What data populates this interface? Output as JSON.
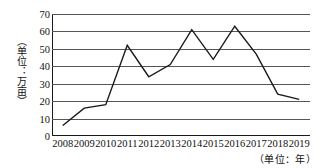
{
  "chart_data": {
    "type": "line",
    "title": "",
    "subtitle": "",
    "xlabel": "（单位：年）",
    "ylabel": "（单位：万亩）",
    "categories": [
      "2008",
      "2009",
      "2010",
      "2011",
      "2012",
      "2013",
      "2014",
      "2015",
      "2016",
      "2017",
      "2018",
      "2019"
    ],
    "values": [
      6,
      16,
      18,
      52,
      34,
      41,
      61,
      44,
      63,
      47,
      24,
      21
    ],
    "series": [
      {
        "name": "面积",
        "values": [
          6,
          16,
          18,
          52,
          34,
          41,
          61,
          44,
          63,
          47,
          24,
          21
        ]
      }
    ],
    "xlim": [
      "2008",
      "2019"
    ],
    "ylim": [
      0,
      70
    ],
    "ytick_values": [
      0,
      10,
      20,
      30,
      40,
      50,
      60,
      70
    ],
    "ytick_labels": [
      "0",
      "10",
      "20",
      "30",
      "40",
      "50",
      "60",
      "70"
    ],
    "xtick_labels": [
      "2008",
      "2009",
      "2010",
      "2011",
      "2012",
      "2013",
      "2014",
      "2015",
      "2016",
      "2017",
      "2018",
      "2019"
    ],
    "grid": true,
    "grid_axis": "y",
    "legend": false,
    "legend_position": "none",
    "annotations": [],
    "line_color": "#1a1a1a",
    "line_width": 1.4,
    "markers": false,
    "background_color": "#ffffff",
    "axis_color": "#1a1a1a",
    "gridline_color": "#555555"
  }
}
